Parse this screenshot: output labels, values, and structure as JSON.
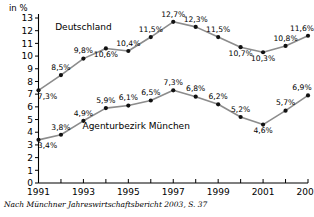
{
  "chart_data": {
    "type": "line",
    "title": "",
    "subtitle": "",
    "xlabel": "",
    "ylabel": "in %",
    "unit_label": "in %",
    "x": [
      1991,
      1992,
      1993,
      1994,
      1995,
      1996,
      1997,
      1998,
      1999,
      2000,
      2001,
      2002,
      2003
    ],
    "xtick_labels": [
      "1991",
      "",
      "1993",
      "",
      "1995",
      "",
      "1997",
      "",
      "1999",
      "",
      "2001",
      "",
      "2003"
    ],
    "xtick_labels_all": [
      "1991",
      "1992",
      "1993",
      "1994",
      "1995",
      "1996",
      "1997",
      "1998",
      "1999",
      "2000",
      "2001",
      "2002",
      "2003"
    ],
    "xlim": [
      1991,
      2003
    ],
    "ylim": [
      0,
      13
    ],
    "ytick_labels": [
      "0",
      "1",
      "2",
      "3",
      "4",
      "5",
      "6",
      "7",
      "8",
      "9",
      "10",
      "11",
      "12",
      "13"
    ],
    "grid": false,
    "legend_position": "inline-annotation",
    "series": [
      {
        "name": "Deutschland",
        "color": "#8c8c8c",
        "marker_color": "#111111",
        "values": [
          7.3,
          8.5,
          9.8,
          10.6,
          10.4,
          11.5,
          12.7,
          12.3,
          11.5,
          10.7,
          10.3,
          10.8,
          11.6
        ],
        "value_labels": [
          "7,3%",
          "8,5%",
          "9,8%",
          "10,6%",
          "10,4%",
          "11,5%",
          "12,7%",
          "12,3%",
          "11,5%",
          "10,7%",
          "10,3%",
          "10,8%",
          "11,6%"
        ],
        "label_side": [
          "below",
          "above",
          "above",
          "below",
          "above",
          "above",
          "above",
          "above",
          "above",
          "below",
          "below",
          "above",
          "above"
        ]
      },
      {
        "name": "Agenturbezirk München",
        "color": "#8c8c8c",
        "marker_color": "#111111",
        "values": [
          3.4,
          3.8,
          4.9,
          5.9,
          6.1,
          6.5,
          7.3,
          6.8,
          6.2,
          5.2,
          4.6,
          5.7,
          6.9
        ],
        "value_labels": [
          "3,4%",
          "3,8%",
          "4,9%",
          "5,9%",
          "6,1%",
          "6,5%",
          "7,3%",
          "6,8%",
          "6,2%",
          "5,2%",
          "4,6%",
          "5,7%",
          "6,9%"
        ],
        "label_side": [
          "below",
          "above",
          "above",
          "above",
          "above",
          "above",
          "above",
          "above",
          "above",
          "above",
          "below",
          "above",
          "above"
        ]
      }
    ],
    "annotations": [
      {
        "text": "Deutschland",
        "x": 1993.0,
        "y": 12.05
      },
      {
        "text": "Agenturbezirk München",
        "x": 1995.35,
        "y": 4.25
      }
    ],
    "caption": "Nach Münchner Jahreswirtschaftsbericht 2003, S. 37"
  }
}
